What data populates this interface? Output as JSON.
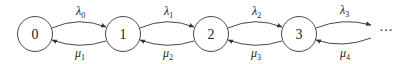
{
  "diagram": {
    "type": "birth-death-markov-chain",
    "states": [
      {
        "id": "0",
        "label": "0",
        "cx": 35,
        "cy": 34
      },
      {
        "id": "1",
        "label": "1",
        "cx": 123,
        "cy": 34
      },
      {
        "id": "2",
        "label": "2",
        "cx": 211,
        "cy": 34
      },
      {
        "id": "3",
        "label": "3",
        "cx": 299,
        "cy": 34
      }
    ],
    "continuation": "···",
    "forward_rates": [
      {
        "symbol": "λ",
        "sub": "0",
        "from": "0",
        "to": "1"
      },
      {
        "symbol": "λ",
        "sub": "1",
        "from": "1",
        "to": "2"
      },
      {
        "symbol": "λ",
        "sub": "2",
        "from": "2",
        "to": "3"
      },
      {
        "symbol": "λ",
        "sub": "3",
        "from": "3",
        "to": "···"
      }
    ],
    "backward_rates": [
      {
        "symbol": "μ",
        "sub": "1",
        "from": "1",
        "to": "0"
      },
      {
        "symbol": "μ",
        "sub": "2",
        "from": "2",
        "to": "1"
      },
      {
        "symbol": "μ",
        "sub": "3",
        "from": "3",
        "to": "2"
      },
      {
        "symbol": "μ",
        "sub": "4",
        "from": "···",
        "to": "3"
      }
    ],
    "colors": {
      "stroke": "#333333",
      "text": "#222222",
      "background": "#ffffff"
    }
  }
}
